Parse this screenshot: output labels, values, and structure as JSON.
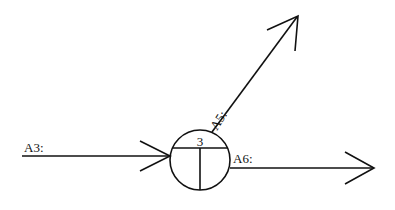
{
  "diagram": {
    "type": "process-flow",
    "node": {
      "id_label": "3",
      "shape": "circle-split",
      "cx": 200,
      "cy": 160,
      "r": 30
    },
    "arrows": [
      {
        "id": "input-a3",
        "label": "A3:",
        "direction": "in",
        "from": [
          22,
          156
        ],
        "to": [
          170,
          156
        ]
      },
      {
        "id": "output-a5",
        "label": "A5:",
        "direction": "out",
        "from": [
          212,
          132
        ],
        "to": [
          331,
          16
        ]
      },
      {
        "id": "output-a6",
        "label": "A6:",
        "direction": "out",
        "from": [
          230,
          168
        ],
        "to": [
          374,
          168
        ]
      }
    ],
    "colors": {
      "stroke": "#111111",
      "background": "#ffffff"
    }
  }
}
